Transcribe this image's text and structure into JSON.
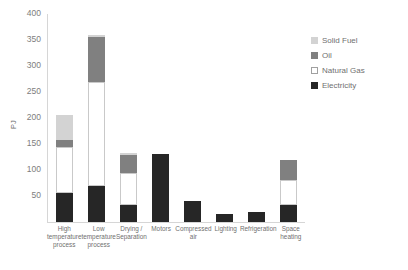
{
  "chart_data": {
    "type": "bar",
    "subtype": "stacked-bar",
    "title": "",
    "xlabel": "",
    "ylabel": "PJ",
    "ylim": [
      0,
      400
    ],
    "yticks": [
      0,
      50,
      100,
      150,
      200,
      250,
      300,
      350,
      400
    ],
    "ytick_labels": [
      "",
      "50",
      "100",
      "150",
      "200",
      "250",
      "300",
      "350",
      "400"
    ],
    "grid": false,
    "legend_position": "right",
    "categories": [
      "High temperature process",
      "Low temperature process",
      "Drying / Separation",
      "Motors",
      "Compressed air",
      "Lighting",
      "Refrigeration",
      "Space heating"
    ],
    "series": [
      {
        "name": "Electricity",
        "color": "#262626",
        "values": [
          55,
          70,
          33,
          130,
          40,
          15,
          20,
          33
        ]
      },
      {
        "name": "Natural Gas",
        "color": "#ffffff",
        "values": [
          90,
          200,
          62,
          0,
          0,
          0,
          0,
          48
        ]
      },
      {
        "name": "Oil",
        "color": "#808080",
        "values": [
          12,
          85,
          33,
          0,
          0,
          0,
          0,
          38
        ]
      },
      {
        "name": "Solid Fuel",
        "color": "#d3d3d3",
        "values": [
          48,
          5,
          4,
          0,
          0,
          0,
          0,
          0
        ]
      }
    ],
    "totals": [
      205,
      360,
      132,
      130,
      40,
      15,
      20,
      119
    ]
  },
  "legend": {
    "items": [
      {
        "label": "Solid Fuel",
        "swatch": "sw-solidfuel"
      },
      {
        "label": "Oil",
        "swatch": "sw-oil"
      },
      {
        "label": "Natural Gas",
        "swatch": "sw-gas"
      },
      {
        "label": "Electricity",
        "swatch": "sw-elec"
      }
    ]
  }
}
